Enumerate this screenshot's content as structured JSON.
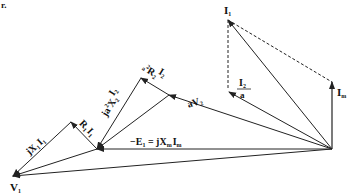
{
  "diagram": {
    "type": "phasor-diagram",
    "corner_mark": "r.",
    "labels": {
      "I1": "I",
      "I1_sub": "1",
      "Im": "I",
      "Im_sub": "m",
      "I2a_num": "I",
      "I2a_num_sub": "2",
      "I2a_den": "a",
      "aV2": "aV",
      "aV2_sub": "2",
      "a2R2": "a",
      "a2R2_sup": "2",
      "a2R2_R": "R",
      "a2R2_sub": "2",
      "a2R2_frac_num": "I",
      "a2R2_frac_sub": "2",
      "a2R2_frac_den": "a",
      "ja2X2": "ja",
      "ja2X2_sup": "2",
      "ja2X2_X": "X",
      "ja2X2_sub": "2",
      "ja2X2_frac_num": "I",
      "ja2X2_frac_sub": "2",
      "ja2X2_frac_den": "a",
      "R1I1": "R",
      "R1I1_sub": "1",
      "R1I1_I": "I",
      "R1I1_Isub": "1",
      "jX1I1": "jX",
      "jX1I1_sub": "1",
      "jX1I1_I": "I",
      "jX1I1_Isub": "1",
      "E1": "−E",
      "E1_sub": "1",
      "E1_eq": " = jX",
      "E1_eq_sub": "m",
      "E1_eq_I": "I",
      "E1_eq_Isub": "m",
      "V1": "V",
      "V1_sub": "1"
    },
    "points": {
      "origin": [
        332,
        149
      ],
      "I1_tip": [
        228,
        20
      ],
      "Im_tip": [
        332,
        82
      ],
      "I2a_tip": [
        229,
        92
      ],
      "aV2_tip": [
        169,
        95
      ],
      "a2R2_tip": [
        141,
        78
      ],
      "E1_tip": [
        97,
        149
      ],
      "jX1I1_vertex": [
        71,
        122
      ],
      "V1_tip": [
        13,
        176
      ]
    },
    "colors": {
      "stroke": "#222222",
      "background": "#ffffff"
    }
  }
}
